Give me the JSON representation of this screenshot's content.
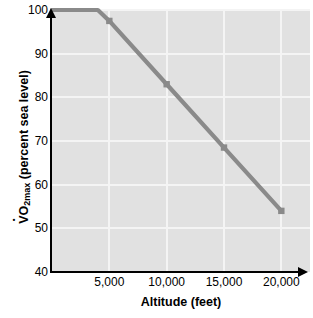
{
  "chart_data": {
    "type": "line",
    "title": "",
    "xlabel": "Altitude (feet)",
    "ylabel": "VO2max (percent sea level)",
    "ylabel_parts": {
      "prefix": "V",
      "sub": "2max",
      "mid": "O",
      "suffix": " (percent sea level)"
    },
    "xlim": [
      0,
      22500
    ],
    "ylim": [
      40,
      100
    ],
    "grid": true,
    "legend": null,
    "x_ticks": [
      5000,
      10000,
      15000,
      20000
    ],
    "x_tick_labels": [
      "5,000",
      "10,000",
      "15,000",
      "20,000"
    ],
    "y_ticks": [
      40,
      50,
      60,
      70,
      80,
      90,
      100
    ],
    "y_tick_labels": [
      "40",
      "50",
      "60",
      "70",
      "80",
      "90",
      "100"
    ],
    "series": [
      {
        "name": "VO2max vs altitude",
        "color": "#8a8a8a",
        "marker": "square",
        "x": [
          0,
          4000,
          5000,
          10000,
          15000,
          20000
        ],
        "y": [
          100,
          100,
          97.5,
          83,
          68.5,
          54
        ],
        "marker_points": [
          {
            "x": 5000,
            "y": 97.5
          },
          {
            "x": 10000,
            "y": 83
          },
          {
            "x": 15000,
            "y": 68.5
          },
          {
            "x": 20000,
            "y": 54
          }
        ]
      }
    ],
    "colors": {
      "plot_background": "#e1e1e1",
      "gridline": "#f4f4f4",
      "axis": "#000000",
      "line": "#8a8a8a",
      "page_background": "#ffffff"
    }
  }
}
